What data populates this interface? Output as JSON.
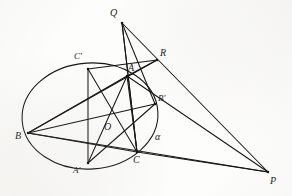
{
  "figure": {
    "kind": "geometry-diagram",
    "ink_color": "#141414",
    "paper_color": "#fdfdfb",
    "stroke_width": 1.05,
    "width": 292,
    "height": 196
  },
  "points": {
    "Q": {
      "label": "Q",
      "x": 122,
      "y": 23,
      "lx": 110,
      "ly": 8,
      "interactable": false
    },
    "R": {
      "label": "R",
      "x": 157,
      "y": 60,
      "lx": 160,
      "ly": 48,
      "interactable": false
    },
    "P": {
      "label": "P",
      "x": 268,
      "y": 172,
      "lx": 270,
      "ly": 176,
      "interactable": false
    },
    "A": {
      "label": "A",
      "x": 127,
      "y": 76,
      "lx": 128,
      "ly": 63,
      "interactable": false
    },
    "B": {
      "label": "B",
      "x": 28,
      "y": 133,
      "lx": 15,
      "ly": 131,
      "interactable": false
    },
    "C": {
      "label": "C",
      "x": 137,
      "y": 152,
      "lx": 133,
      "ly": 155,
      "interactable": false
    },
    "Ap": {
      "label": "A'",
      "x": 88,
      "y": 163,
      "lx": 73,
      "ly": 166,
      "interactable": false
    },
    "Bp": {
      "label": "B'",
      "x": 155,
      "y": 104,
      "lx": 158,
      "ly": 94,
      "interactable": false
    },
    "Cp": {
      "label": "C'",
      "x": 88,
      "y": 69,
      "lx": 74,
      "ly": 52,
      "interactable": false
    },
    "O": {
      "label": "O",
      "x": 105,
      "y": 123,
      "lx": 104,
      "ly": 122,
      "interactable": false
    }
  },
  "conic": {
    "name": "alpha",
    "label": "α",
    "label_x": 155,
    "label_y": 132,
    "cx": 90,
    "cy": 116,
    "rx": 68,
    "ry": 53,
    "rotation_deg": -4
  },
  "segments": [
    {
      "name": "Q-A-C",
      "from": "Q",
      "to": "C",
      "note": "cevian through A"
    },
    {
      "name": "Q-R-P",
      "from": "Q",
      "to": "P",
      "note": "through R"
    },
    {
      "name": "Q-Bp",
      "from": "Q",
      "to": "Bp"
    },
    {
      "name": "Q-Cleft",
      "from": "Q",
      "to": "C"
    },
    {
      "name": "R-A",
      "from": "R",
      "to": "A"
    },
    {
      "name": "R-Cp",
      "from": "R",
      "to": "Cp"
    },
    {
      "name": "R-B",
      "from": "R",
      "to": "B"
    },
    {
      "name": "A-B",
      "from": "A",
      "to": "B"
    },
    {
      "name": "A-C",
      "from": "A",
      "to": "C"
    },
    {
      "name": "A-Ap",
      "from": "A",
      "to": "Ap"
    },
    {
      "name": "A-P",
      "from": "A",
      "to": "P"
    },
    {
      "name": "B-Bp",
      "from": "B",
      "to": "Bp"
    },
    {
      "name": "B-C",
      "from": "B",
      "to": "C"
    },
    {
      "name": "B-P",
      "from": "B",
      "to": "P"
    },
    {
      "name": "C-P",
      "from": "C",
      "to": "P"
    },
    {
      "name": "C-Cp",
      "from": "C",
      "to": "Cp"
    },
    {
      "name": "Cp-Ap",
      "from": "Cp",
      "to": "Ap"
    },
    {
      "name": "Bp-Ap",
      "from": "Bp",
      "to": "Ap"
    }
  ],
  "labels_order": [
    "Q",
    "R",
    "Cp",
    "A",
    "Bp",
    "B",
    "O",
    "C",
    "Ap",
    "P"
  ]
}
